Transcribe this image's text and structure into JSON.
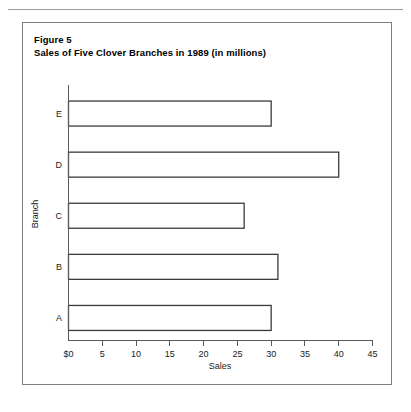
{
  "figure": {
    "label": "Figure 5",
    "caption": "Sales of Five Clover Branches in 1989 (in millions)"
  },
  "chart_data": {
    "type": "bar",
    "orientation": "horizontal",
    "title": "Sales of Five Clover Branches in 1989 (in millions)",
    "categories": [
      "A",
      "B",
      "C",
      "D",
      "E"
    ],
    "values": [
      30,
      31,
      26,
      40,
      30
    ],
    "xlabel": "Sales",
    "ylabel": "Branch",
    "xlim": [
      0,
      45
    ],
    "xticks": [
      0,
      5,
      10,
      15,
      20,
      25,
      30,
      35,
      40,
      45
    ],
    "xticklabels": [
      "$0",
      "5",
      "10",
      "15",
      "20",
      "25",
      "30",
      "35",
      "40",
      "45"
    ],
    "grid": false,
    "legend": null,
    "bar_fill_color": "#ffffff",
    "bar_edge_color": "#3b3b3b",
    "axis_color": "#58595b"
  }
}
